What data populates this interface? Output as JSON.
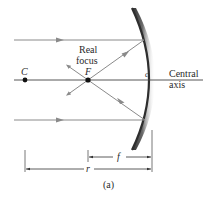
{
  "figure": {
    "caption": "(a)",
    "labels": {
      "center_point": "C",
      "focal_point": "F",
      "real_focus_line1": "Real",
      "real_focus_line2": "focus",
      "mirror_vertex": "c",
      "axis_line1": "Central",
      "axis_line2": "axis",
      "focal_length": "f",
      "radius": "r"
    },
    "colors": {
      "ray": "#8a8a8a",
      "axis": "#444444",
      "mirror_dark": "#3a3a3a",
      "mirror_light": "#ffffff",
      "text": "#2a2a2a",
      "point": "#111111"
    }
  }
}
